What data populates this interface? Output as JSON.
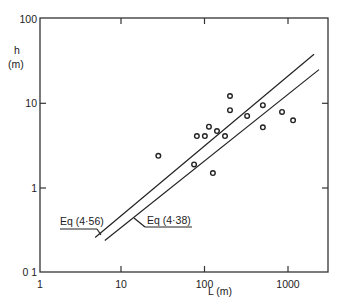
{
  "chart_data": {
    "type": "scatter",
    "title": "",
    "xlabel": "L  (m)",
    "ylabel_line1": "h",
    "ylabel_line2": "(m)",
    "xscale": "log",
    "yscale": "log",
    "xlim": [
      1,
      3000
    ],
    "ylim": [
      0.1,
      100
    ],
    "x_ticks": [
      {
        "value": 1,
        "label": "1"
      },
      {
        "value": 10,
        "label": "10"
      },
      {
        "value": 100,
        "label": "100"
      },
      {
        "value": 1000,
        "label": "1000"
      }
    ],
    "y_ticks": [
      {
        "value": 0.1,
        "label": "0 1"
      },
      {
        "value": 1,
        "label": "1"
      },
      {
        "value": 10,
        "label": "10"
      },
      {
        "value": 100,
        "label": "100"
      }
    ],
    "grid": false,
    "series": [
      {
        "name": "observations",
        "marker": "open-circle",
        "points": [
          {
            "L": 28,
            "h": 2.4
          },
          {
            "L": 75,
            "h": 1.9
          },
          {
            "L": 81,
            "h": 4.1
          },
          {
            "L": 101,
            "h": 4.1
          },
          {
            "L": 113,
            "h": 5.3
          },
          {
            "L": 126,
            "h": 1.5
          },
          {
            "L": 141,
            "h": 4.7
          },
          {
            "L": 176,
            "h": 4.1
          },
          {
            "L": 202,
            "h": 12.2
          },
          {
            "L": 202,
            "h": 8.3
          },
          {
            "L": 324,
            "h": 7.1
          },
          {
            "L": 500,
            "h": 9.5
          },
          {
            "L": 500,
            "h": 5.2
          },
          {
            "L": 848,
            "h": 7.9
          },
          {
            "L": 1150,
            "h": 6.3
          }
        ]
      }
    ],
    "lines": [
      {
        "name": "Eq (4·56)",
        "from": {
          "L": 4.9,
          "h": 0.26
        },
        "to": {
          "L": 2050,
          "h": 38
        }
      },
      {
        "name": "Eq (4·38)",
        "from": {
          "L": 6.4,
          "h": 0.24
        },
        "to": {
          "L": 2350,
          "h": 25
        }
      }
    ],
    "annotations": [
      {
        "text": "Eq (4·56)",
        "text_x": 60,
        "text_y": 225,
        "underline": [
          60,
          229,
          97,
          229
        ],
        "leader": [
          97,
          229,
          101,
          235
        ]
      },
      {
        "text": "Eq (4·38)",
        "text_x": 147,
        "text_y": 224,
        "underline": [
          145,
          227,
          192,
          227
        ],
        "leader": [
          145,
          227,
          134,
          218
        ]
      }
    ]
  },
  "plot_area": {
    "left": 40,
    "top": 18,
    "right": 328,
    "bottom": 272,
    "x_decade_origin_px": 37.5,
    "x_px_per_decade": 83.5,
    "y_origin_px": 188,
    "y_px_per_decade": 84.7
  }
}
